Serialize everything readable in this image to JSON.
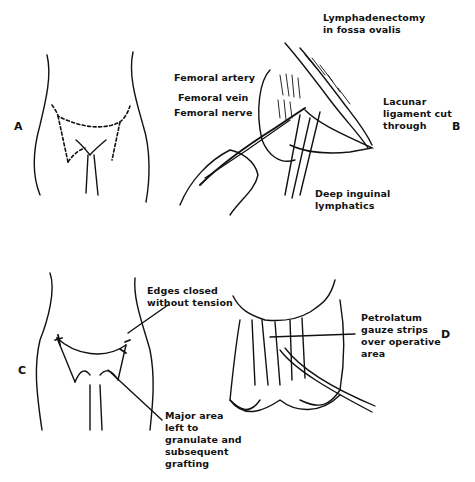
{
  "figure": {
    "panels": [
      {
        "id": "A",
        "letter": "A",
        "labels": []
      },
      {
        "id": "B",
        "letter": "B",
        "labels": [
          {
            "text": "Lymphadenectomy\nin fossa ovalis"
          },
          {
            "text": "Femoral artery"
          },
          {
            "text": "Femoral vein"
          },
          {
            "text": "Femoral nerve"
          },
          {
            "text": "Lacunar\nligament cut\nthrough"
          },
          {
            "text": "Deep inguinal\nlymphatics"
          }
        ]
      },
      {
        "id": "C",
        "letter": "C",
        "labels": [
          {
            "text": "Edges closed\nwithout tension"
          },
          {
            "text": "Major area\nleft to\ngranulate and\nsubsequent\ngrafting"
          }
        ]
      },
      {
        "id": "D",
        "letter": "D",
        "labels": [
          {
            "text": "Petrolatum\ngauze strips\nover operative\narea"
          }
        ]
      }
    ],
    "colors": {
      "ink": "#111111",
      "background": "#ffffff"
    }
  }
}
